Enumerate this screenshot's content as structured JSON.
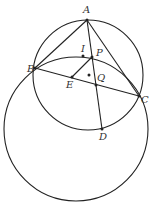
{
  "diagram": {
    "stroke_color": "#222222",
    "background": "#ffffff",
    "circles": [
      {
        "name": "circumcircle-ABC",
        "cx": 88,
        "cy": 75,
        "r": 55
      },
      {
        "name": "large-circle",
        "cx": 76,
        "cy": 129,
        "r": 72
      }
    ],
    "points": {
      "A": {
        "x": 87,
        "y": 20,
        "label": "A",
        "lx": 83,
        "ly": 13
      },
      "B": {
        "x": 35,
        "y": 68,
        "label": "B",
        "lx": 27,
        "ly": 72
      },
      "C": {
        "x": 139,
        "y": 96,
        "label": "C",
        "lx": 141,
        "ly": 103
      },
      "P": {
        "x": 92,
        "y": 57,
        "label": "P",
        "lx": 96,
        "ly": 56
      },
      "I": {
        "x": 83,
        "y": 56,
        "label": "I",
        "lx": 81,
        "ly": 52
      },
      "E": {
        "x": 72,
        "y": 77,
        "label": "E",
        "lx": 66,
        "ly": 88
      },
      "Q": {
        "x": 96,
        "y": 85,
        "label": "Q",
        "lx": 97,
        "ly": 81
      },
      "D": {
        "x": 102,
        "y": 129,
        "label": "D",
        "lx": 99,
        "ly": 140
      },
      "O": {
        "x": 89,
        "y": 75,
        "label": ""
      }
    },
    "segments": [
      [
        "A",
        "B"
      ],
      [
        "A",
        "C"
      ],
      [
        "B",
        "C"
      ],
      [
        "A",
        "D"
      ],
      [
        "P",
        "E"
      ]
    ]
  }
}
